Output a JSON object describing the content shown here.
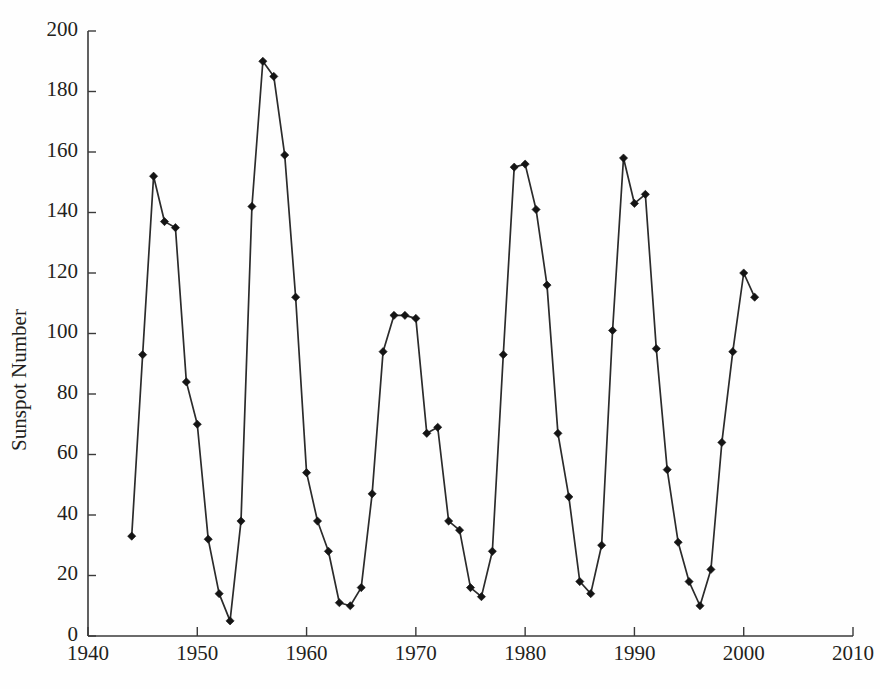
{
  "chart_data": {
    "type": "line",
    "title": "",
    "subtitle": "",
    "xlabel": "",
    "ylabel": "Sunspot Number",
    "xlim": [
      1940,
      2010
    ],
    "ylim": [
      0,
      200
    ],
    "xticks": [
      1940,
      1950,
      1960,
      1970,
      1980,
      1990,
      2000,
      2010
    ],
    "yticks": [
      0,
      20,
      40,
      60,
      80,
      100,
      120,
      140,
      160,
      180,
      200
    ],
    "grid": false,
    "legend": null,
    "marker": "diamond",
    "line_color": "#2b2b2b",
    "marker_color": "#141414",
    "background_color": "#ffffff",
    "x": [
      1944,
      1945,
      1946,
      1947,
      1948,
      1949,
      1950,
      1951,
      1952,
      1953,
      1954,
      1955,
      1956,
      1957,
      1958,
      1959,
      1960,
      1961,
      1962,
      1963,
      1964,
      1965,
      1966,
      1967,
      1968,
      1969,
      1970,
      1971,
      1972,
      1973,
      1974,
      1975,
      1976,
      1977,
      1978,
      1979,
      1980,
      1981,
      1982,
      1983,
      1984,
      1985,
      1986,
      1987,
      1988,
      1989,
      1990,
      1991,
      1992,
      1993,
      1994,
      1995,
      1996,
      1997,
      1998,
      1999,
      2000,
      2001
    ],
    "y": [
      33,
      93,
      152,
      137,
      135,
      84,
      70,
      32,
      14,
      5,
      38,
      142,
      190,
      185,
      159,
      112,
      54,
      38,
      28,
      11,
      10,
      16,
      47,
      94,
      106,
      106,
      105,
      67,
      69,
      38,
      35,
      16,
      13,
      28,
      93,
      155,
      156,
      141,
      116,
      67,
      46,
      18,
      14,
      30,
      101,
      158,
      143,
      146,
      95,
      55,
      31,
      18,
      10,
      22,
      64,
      94,
      120,
      112
    ],
    "series": [
      {
        "name": "Annual mean sunspot number",
        "values": [
          33,
          93,
          152,
          137,
          135,
          84,
          70,
          32,
          14,
          5,
          38,
          142,
          190,
          185,
          159,
          112,
          54,
          38,
          28,
          11,
          10,
          16,
          47,
          94,
          106,
          106,
          105,
          67,
          69,
          38,
          35,
          16,
          13,
          28,
          93,
          155,
          156,
          141,
          116,
          67,
          46,
          18,
          14,
          30,
          101,
          158,
          143,
          146,
          95,
          55,
          31,
          18,
          10,
          22,
          64,
          94,
          120,
          112
        ]
      }
    ],
    "annotations": []
  },
  "axes": {
    "y_title": "Sunspot Number",
    "x_tick_labels": [
      "1940",
      "1950",
      "1960",
      "1970",
      "1980",
      "1990",
      "2000",
      "2010"
    ],
    "y_tick_labels": [
      "0",
      "20",
      "40",
      "60",
      "80",
      "100",
      "120",
      "140",
      "160",
      "180",
      "200"
    ]
  }
}
